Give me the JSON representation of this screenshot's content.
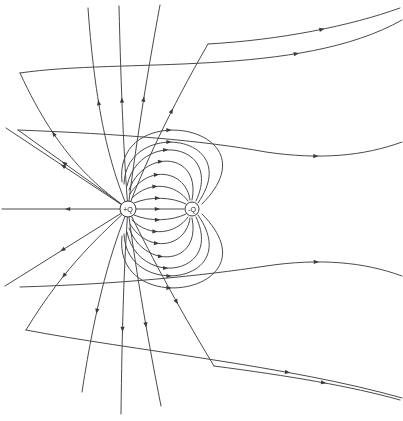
{
  "figure": {
    "type": "field-line-diagram",
    "width": 403,
    "height": 421,
    "background_color": "#ffffff",
    "line_color": "#4a4a4a",
    "arrow_color": "#3a3a3a"
  },
  "charges": [
    {
      "id": "positive",
      "label": "+Q",
      "sign": "+",
      "cx": 128,
      "cy": 209,
      "r": 8,
      "fill": "#ffffff",
      "stroke": "#3a3a3a"
    },
    {
      "id": "negative",
      "label": "-Q",
      "sign": "-",
      "cx": 192,
      "cy": 209,
      "r": 7,
      "fill": "#ffffff",
      "stroke": "#3a3a3a"
    }
  ],
  "chart_data": {
    "type": "line",
    "xlabel": "",
    "ylabel": "",
    "xlim": [
      0,
      403
    ],
    "ylim": [
      0,
      421
    ],
    "grid": false,
    "legend": "none",
    "annotations": [
      "+Q",
      "-Q"
    ],
    "series": [
      {
        "name": "radial-left-1",
        "path": "M128,209 L6,128",
        "arrows": [
          {
            "t": 0.55
          }
        ]
      },
      {
        "name": "radial-left-2",
        "path": "M128,209 L2,209",
        "arrows": [
          {
            "t": 0.5
          }
        ]
      },
      {
        "name": "radial-left-3",
        "path": "M128,209 L5,286",
        "arrows": [
          {
            "t": 0.55
          }
        ]
      },
      {
        "name": "radial-ul-1",
        "path": "M128,209 L18,130",
        "arrows": [
          {
            "t": 0.6
          }
        ]
      },
      {
        "name": "radial-ul-2",
        "path": "M128,209 C100,188 60,160 20,73",
        "arrows": [
          {
            "t": 0.62
          }
        ]
      },
      {
        "name": "radial-ul-3",
        "path": "M128,209 C112,170 96,120 88,8",
        "arrows": [
          {
            "t": 0.55
          }
        ]
      },
      {
        "name": "radial-up-1",
        "path": "M128,209 C124,160 121,90 119,6",
        "arrows": [
          {
            "t": 0.55
          }
        ]
      },
      {
        "name": "radial-up-2",
        "path": "M128,209 C134,158 146,80 160,5",
        "arrows": [
          {
            "t": 0.55
          }
        ]
      },
      {
        "name": "radial-ur-1",
        "path": "M128,209 C142,170 170,110 208,44",
        "arrows": [
          {
            "t": 0.6
          }
        ]
      },
      {
        "name": "radial-ll-1",
        "path": "M128,209 C104,232 66,264 26,330",
        "arrows": [
          {
            "t": 0.6
          }
        ]
      },
      {
        "name": "radial-ll-2",
        "path": "M128,209 C112,248 96,300 82,392",
        "arrows": [
          {
            "t": 0.58
          }
        ]
      },
      {
        "name": "radial-down-1",
        "path": "M128,209 C124,262 122,330 121,414",
        "arrows": [
          {
            "t": 0.6
          }
        ]
      },
      {
        "name": "radial-down-2",
        "path": "M128,209 C134,258 146,330 161,406",
        "arrows": [
          {
            "t": 0.6
          }
        ]
      },
      {
        "name": "radial-lr-1",
        "path": "M128,209 C146,246 174,300 214,366",
        "arrows": [
          {
            "t": 0.6
          }
        ]
      },
      {
        "name": "axis-line",
        "path": "M136,209 L184,209",
        "arrows": [
          {
            "t": 0.5
          }
        ]
      },
      {
        "name": "loop-upper-1",
        "path": "M134,203 C150,196 172,197 186,204",
        "arrows": [
          {
            "t": 0.5
          }
        ]
      },
      {
        "name": "loop-upper-2",
        "path": "M132,198 C150,180 176,184 188,201",
        "arrows": [
          {
            "t": 0.45
          }
        ]
      },
      {
        "name": "loop-upper-3",
        "path": "M130,194 C148,164 186,170 190,200",
        "arrows": [
          {
            "t": 0.45
          }
        ]
      },
      {
        "name": "loop-upper-4",
        "path": "M129,190 C144,148 202,152 192,200",
        "arrows": [
          {
            "t": 0.45
          }
        ]
      },
      {
        "name": "loop-upper-5",
        "path": "M127,186 C138,130 224,142 196,201",
        "arrows": [
          {
            "t": 0.45
          }
        ]
      },
      {
        "name": "loop-upper-6",
        "path": "M124,184 C126,118 246,134 198,203",
        "arrows": [
          {
            "t": 0.45
          }
        ]
      },
      {
        "name": "loop-lower-1",
        "path": "M134,215 C150,222 172,221 186,214",
        "arrows": [
          {
            "t": 0.5
          }
        ]
      },
      {
        "name": "loop-lower-2",
        "path": "M132,220 C150,238 176,234 188,217",
        "arrows": [
          {
            "t": 0.45
          }
        ]
      },
      {
        "name": "loop-lower-3",
        "path": "M130,224 C148,254 186,248 190,218",
        "arrows": [
          {
            "t": 0.45
          }
        ]
      },
      {
        "name": "loop-lower-4",
        "path": "M129,228 C144,270 202,266 192,218",
        "arrows": [
          {
            "t": 0.45
          }
        ]
      },
      {
        "name": "loop-lower-5",
        "path": "M127,232 C138,288 224,276 196,217",
        "arrows": [
          {
            "t": 0.45
          }
        ]
      },
      {
        "name": "loop-lower-6",
        "path": "M124,234 C126,300 246,284 198,215",
        "arrows": [
          {
            "t": 0.45
          }
        ]
      },
      {
        "name": "outer-lobe-up",
        "path": "M122,182 C112,96 280,126 202,204",
        "arrows": [
          {
            "t": 0.42
          }
        ]
      },
      {
        "name": "outer-lobe-dn",
        "path": "M122,236 C112,322 280,292 202,214",
        "arrows": [
          {
            "t": 0.42
          }
        ]
      },
      {
        "name": "far-upper-1",
        "path": "M20,73 C120,58 300,78 402,20",
        "arrows": [
          {
            "t": 0.72
          }
        ]
      },
      {
        "name": "far-upper-2",
        "path": "M208,44 C280,40 350,26 400,8",
        "arrows": [
          {
            "t": 0.6
          }
        ]
      },
      {
        "name": "far-mid-up",
        "path": "M18,130 C120,134 200,140 266,152 C320,160 364,156 402,142",
        "arrows": [
          {
            "t": 0.78
          }
        ]
      },
      {
        "name": "far-mid-dn",
        "path": "M20,287 C120,284 200,276 266,266 C320,258 364,262 402,276",
        "arrows": [
          {
            "t": 0.78
          }
        ]
      },
      {
        "name": "far-lower-1",
        "path": "M26,330 C130,350 290,366 402,398",
        "arrows": [
          {
            "t": 0.7
          }
        ]
      },
      {
        "name": "far-lower-2",
        "path": "M214,366 C290,376 350,386 400,400",
        "arrows": [
          {
            "t": 0.6
          }
        ]
      }
    ]
  }
}
